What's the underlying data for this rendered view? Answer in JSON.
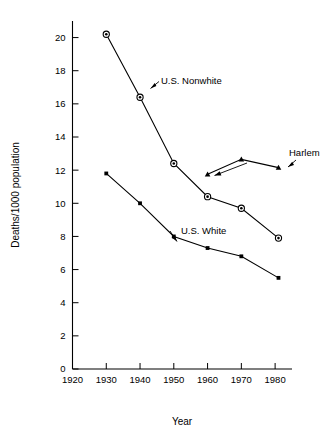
{
  "chart_data": {
    "type": "line",
    "title": "",
    "xlabel": "Year",
    "ylabel": "Deaths/1000 population",
    "xlim": [
      1920,
      1985
    ],
    "ylim": [
      0,
      21
    ],
    "xticks": [
      1920,
      1930,
      1940,
      1950,
      1960,
      1970,
      1980
    ],
    "yticks": [
      0,
      2,
      4,
      6,
      8,
      10,
      12,
      14,
      16,
      18,
      20
    ],
    "xtick_labels": [
      "1920",
      "1930",
      "1940",
      "1950",
      "1960",
      "1970",
      "1980"
    ],
    "ytick_labels": [
      "0",
      "2",
      "4",
      "6",
      "8",
      "10",
      "12",
      "14",
      "16",
      "18",
      "20"
    ],
    "grid": false,
    "legend": "inline-annotations",
    "series": [
      {
        "name": "U.S. Nonwhite",
        "marker": "bullseye-circle",
        "x": [
          1930,
          1940,
          1950,
          1960,
          1970,
          1981
        ],
        "values": [
          20.2,
          16.4,
          12.4,
          10.4,
          9.7,
          7.9
        ]
      },
      {
        "name": "U.S. White",
        "marker": "small-filled-square",
        "x": [
          1930,
          1940,
          1950,
          1960,
          1970,
          1981
        ],
        "values": [
          11.8,
          10.0,
          8.0,
          7.3,
          6.8,
          5.5
        ]
      },
      {
        "name": "Harlem",
        "marker": "filled-triangle",
        "x": [
          1960,
          1970,
          1981
        ],
        "values": [
          11.75,
          12.65,
          12.15
        ]
      }
    ],
    "annotations": [
      {
        "text": "U.S. Nonwhite",
        "points_to_series": "U.S. Nonwhite"
      },
      {
        "text": "U.S. White",
        "points_to_series": "U.S. White"
      },
      {
        "text": "Harlem",
        "points_to_series": "Harlem"
      }
    ]
  },
  "axes": {
    "y_title": "Deaths/1000 population",
    "x_title": "Year"
  }
}
